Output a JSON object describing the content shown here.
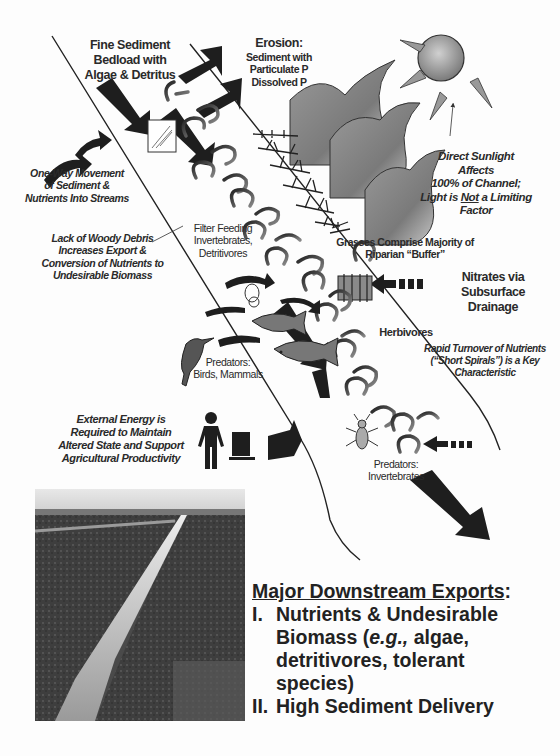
{
  "diagram": {
    "labels": {
      "fine_sediment": [
        "Fine Sediment",
        "Bedload with",
        "Algae & Detritus"
      ],
      "erosion_title": "Erosion:",
      "erosion_lines": [
        "Sediment with",
        "Particulate P",
        "Dissolved P"
      ],
      "one_way": [
        "One-Way Movement",
        "of Sediment &",
        "Nutrients Into Streams"
      ],
      "woody_debris": [
        "Lack of Woody Debris",
        "Increases Export &",
        "Conversion of Nutrients to",
        "Undesirable Biomass"
      ],
      "filter_feeding": [
        "Filter Feeding",
        "Invertebrates,",
        "Detritivores"
      ],
      "grasses": [
        "Grasses Comprise Majority of",
        "Riparian “Buffer”"
      ],
      "sunlight": [
        "Direct Sunlight  Affects",
        "100% of Channel;"
      ],
      "sunlight_line3_pre": "Light is ",
      "sunlight_line3_not": "Not",
      "sunlight_line3_post": " a Limiting",
      "sunlight_line4": "Factor",
      "nitrates": [
        "Nitrates via",
        "Subsurface",
        "Drainage"
      ],
      "herbivores": "Herbivores",
      "rapid_turnover": [
        "Rapid Turnover of Nutrients",
        "(“Short Spirals”) is a Key",
        "Characteristic"
      ],
      "predators_birds": [
        "Predators:",
        "Birds, Mammals"
      ],
      "predators_invert": [
        "Predators:",
        "Invertebrates"
      ],
      "external_energy": [
        "External Energy is",
        "Required to Maintain",
        "Altered State and Support",
        "Agricultural Productivity"
      ]
    },
    "icons": [
      "sun-icon",
      "hill-icon",
      "grass-icon",
      "drain-tile-icon",
      "fish-icon",
      "bird-icon",
      "snail-icon",
      "insect-icon",
      "person-icon",
      "tractor-icon",
      "spiral-arrow-icon",
      "flow-arrow-icon"
    ],
    "photo": {
      "description": "Agricultural drainage ditch photograph"
    },
    "exports": {
      "title": "Major Downstream Exports",
      "colon": ":",
      "items": [
        {
          "num": "I.",
          "lines": [
            "Nutrients & Undesirable"
          ],
          "biomass_pre": "Biomass (",
          "biomass_ital": "e.g.,",
          "biomass_post": " algae,",
          "rest": [
            "detritivores, tolerant",
            "species)"
          ]
        },
        {
          "num": "II.",
          "lines": [
            "High Sediment Delivery"
          ]
        }
      ]
    },
    "colors": {
      "ink": "#222222",
      "arrow": "#1e1e1e",
      "shade": "#8a8a8a",
      "paper": "#fdfdfd"
    }
  }
}
